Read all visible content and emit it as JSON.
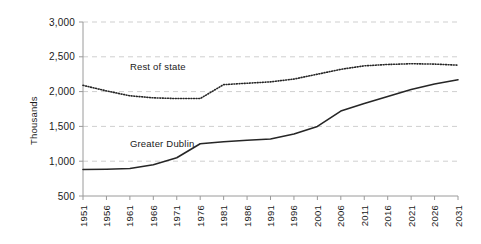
{
  "chart_data": {
    "type": "line",
    "title": "",
    "xlabel": "",
    "ylabel": "Thousands",
    "x": [
      1951,
      1956,
      1961,
      1966,
      1971,
      1976,
      1981,
      1986,
      1991,
      1996,
      2001,
      2006,
      2011,
      2016,
      2021,
      2026,
      2031
    ],
    "xtick_labels": [
      "1951",
      "1956",
      "1961",
      "1966",
      "1971",
      "1976",
      "1981",
      "1986",
      "1991",
      "1996",
      "2001",
      "2006",
      "2011",
      "2016",
      "2021",
      "2026",
      "2031"
    ],
    "ytick_labels": [
      "500",
      "1,000",
      "1,500",
      "2,000",
      "2,500",
      "3,000"
    ],
    "ytick_values": [
      500,
      1000,
      1500,
      2000,
      2500,
      3000
    ],
    "ylim": [
      500,
      3000
    ],
    "xlim": [
      1951,
      2031
    ],
    "grid": "horizontal-dashed",
    "legend": "inline-labels",
    "series": [
      {
        "name": "Rest of state",
        "style": "dotted",
        "color": "#262626",
        "label_x": 1961,
        "label_y": 2310,
        "values": [
          2090,
          2010,
          1940,
          1910,
          1900,
          1900,
          2100,
          2120,
          2140,
          2180,
          2250,
          2320,
          2370,
          2390,
          2400,
          2395,
          2380
        ]
      },
      {
        "name": "Greater Dublin",
        "style": "solid",
        "color": "#262626",
        "label_x": 1961,
        "label_y": 1200,
        "values": [
          880,
          885,
          895,
          950,
          1050,
          1250,
          1280,
          1300,
          1320,
          1390,
          1500,
          1720,
          1830,
          1930,
          2030,
          2110,
          2170
        ]
      }
    ]
  }
}
